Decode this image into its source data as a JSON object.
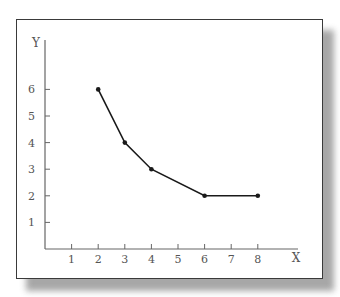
{
  "chart_data": {
    "type": "line",
    "title": "",
    "xlabel": "X",
    "ylabel": "Y",
    "x_ticks": [
      1,
      2,
      3,
      4,
      5,
      6,
      7,
      8
    ],
    "y_ticks": [
      1,
      2,
      3,
      4,
      5,
      6
    ],
    "xlim": [
      0,
      9.5
    ],
    "ylim": [
      0,
      7.6
    ],
    "grid": false,
    "legend": null,
    "series": [
      {
        "name": "series-1",
        "x": [
          2,
          3,
          4,
          6,
          8
        ],
        "y": [
          6,
          4,
          3,
          2,
          2
        ],
        "color": "#1a1a1a",
        "markers": true
      }
    ]
  },
  "colors": {
    "axis": "#666666",
    "line": "#1a1a1a",
    "frame": "#3a3a3a"
  }
}
